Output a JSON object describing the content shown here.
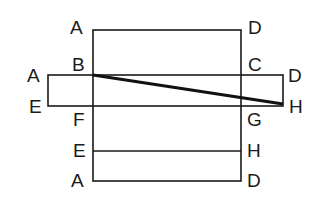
{
  "diagram": {
    "labels": {
      "top_left_A": "A",
      "top_right_D": "D",
      "B": "B",
      "C": "C",
      "band_left_A": "A",
      "band_right_D": "D",
      "band_left_E": "E",
      "band_right_H": "H",
      "F": "F",
      "G": "G",
      "lower_E": "E",
      "lower_H": "H",
      "bottom_A": "A",
      "bottom_D": "D"
    },
    "colors": {
      "stroke": "#1a1a1a",
      "background": "#ffffff"
    }
  }
}
